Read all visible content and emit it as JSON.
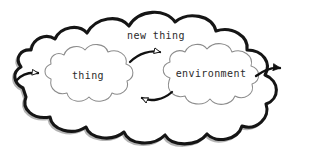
{
  "diagram": {
    "type": "hand-drawn-cloud-diagram",
    "background_color": "#ffffff",
    "outer_cloud": {
      "label": "new thing",
      "stroke_color": "#1a1a1a",
      "fill_color": "#ffffff",
      "style": "thick hand-drawn scalloped outline"
    },
    "inner_clouds": [
      {
        "id": "thing",
        "label": "thing",
        "stroke_color": "#8a8a8a",
        "fill_color": "#ffffff",
        "style": "thin hand-drawn scalloped outline"
      },
      {
        "id": "environment",
        "label": "environment",
        "stroke_color": "#8a8a8a",
        "fill_color": "#ffffff",
        "style": "thin hand-drawn scalloped outline"
      }
    ],
    "arrows": [
      {
        "id": "boundary-to-thing",
        "from": "outer-cloud-left-boundary",
        "to": "thing",
        "direction": "rightward",
        "arrowhead": "hollow-triangle",
        "stroke_color": "#111111"
      },
      {
        "id": "thing-to-environment",
        "from": "thing",
        "to": "environment",
        "direction": "rightward",
        "arrowhead": "hollow-triangle",
        "stroke_color": "#111111"
      },
      {
        "id": "environment-to-thing",
        "from": "environment",
        "to": "thing",
        "direction": "leftward",
        "arrowhead": "hollow-triangle",
        "stroke_color": "#111111"
      },
      {
        "id": "environment-to-boundary",
        "from": "environment",
        "to": "outer-cloud-right-boundary",
        "direction": "rightward",
        "arrowhead": "solid-triangle",
        "stroke_color": "#111111"
      }
    ]
  }
}
